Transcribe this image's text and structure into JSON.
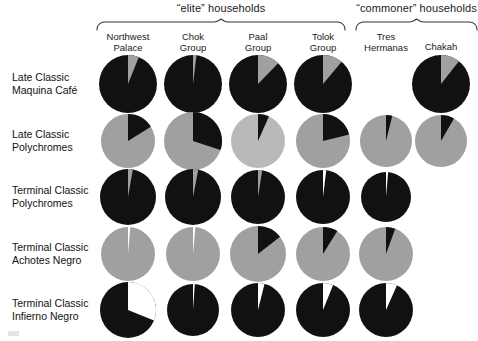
{
  "figure": {
    "colors": {
      "dark": "#111111",
      "light": "#a0a0a0",
      "white": "#ffffff",
      "brace": "#333333"
    },
    "group_braces": [
      {
        "label": "“elite” households",
        "x": 96,
        "y": 18,
        "width": 250,
        "label_y": 2
      },
      {
        "label": "“commoner” households",
        "x": 355,
        "y": 18,
        "width": 123,
        "label_y": 2
      }
    ],
    "columns": [
      {
        "id": "northwest-palace",
        "label_line1": "Northwest",
        "label_line2": "Palace",
        "cx": 128
      },
      {
        "id": "chok-group",
        "label_line1": "Chok",
        "label_line2": "Group",
        "cx": 193
      },
      {
        "id": "paal-group",
        "label_line1": "Paal",
        "label_line2": "Group",
        "cx": 258
      },
      {
        "id": "tolok-group",
        "label_line1": "Tolok",
        "label_line2": "Group",
        "cx": 323
      },
      {
        "id": "tres-hermanas",
        "label_line1": "Tres",
        "label_line2": "Hermanas",
        "cx": 386
      },
      {
        "id": "chakah",
        "label_line1": "Chakah",
        "label_line2": "",
        "cx": 441
      }
    ],
    "rows": [
      {
        "id": "late-classic-maquina-cafe",
        "label_line1": "Late Classic",
        "label_line2": "Maquina Café",
        "cy": 84
      },
      {
        "id": "late-classic-polychromes",
        "label_line1": "Late Classic",
        "label_line2": "Polychromes",
        "cy": 141
      },
      {
        "id": "terminal-classic-polychromes",
        "label_line1": "Terminal Classic",
        "label_line2": "Polychromes",
        "cy": 197
      },
      {
        "id": "terminal-classic-achotes-negro",
        "label_line1": "Terminal Classic",
        "label_line2": "Achotes Negro",
        "cy": 254
      },
      {
        "id": "terminal-classic-infierno-negro",
        "label_line1": "Terminal Classic",
        "label_line2": "Infierno Negro",
        "cy": 310
      }
    ]
  },
  "chart_data": {
    "type": "pie",
    "legend": [
      {
        "name": "present / dark fraction",
        "color": "#111111"
      },
      {
        "name": "remainder / light fraction",
        "color": "#a0a0a0"
      },
      {
        "name": "absent / white wedge",
        "color": "#ffffff"
      }
    ],
    "categories": [
      "Northwest Palace",
      "Chok Group",
      "Paal Group",
      "Tolok Group",
      "Tres Hermanas",
      "Chakah"
    ],
    "row_names": [
      "Late Classic Maquina Café",
      "Late Classic Polychromes",
      "Terminal Classic Polychromes",
      "Terminal Classic Achotes Negro",
      "Terminal Classic Infierno Negro"
    ],
    "pies": [
      {
        "row": "Late Classic Maquina Café",
        "cells": [
          {
            "column": "Northwest Palace",
            "present": true,
            "radius": 29,
            "base": "#111111",
            "wedges": [
              {
                "color": "#a0a0a0",
                "start": 0,
                "end": 22
              }
            ],
            "values": {
              "dark": 94,
              "light": 6
            }
          },
          {
            "column": "Chok Group",
            "present": true,
            "radius": 29,
            "base": "#111111",
            "wedges": [
              {
                "color": "#a0a0a0",
                "start": 0,
                "end": 7
              }
            ],
            "values": {
              "dark": 98,
              "light": 2
            }
          },
          {
            "column": "Paal Group",
            "present": true,
            "radius": 29,
            "base": "#111111",
            "wedges": [
              {
                "color": "#a0a0a0",
                "start": 0,
                "end": 44
              }
            ],
            "values": {
              "dark": 88,
              "light": 12
            }
          },
          {
            "column": "Tolok Group",
            "present": true,
            "radius": 29,
            "base": "#111111",
            "wedges": [
              {
                "color": "#a0a0a0",
                "start": 0,
                "end": 40
              }
            ],
            "values": {
              "dark": 89,
              "light": 11
            }
          },
          {
            "column": "Tres Hermanas",
            "present": false,
            "radius": 29,
            "base": "#111111",
            "wedges": [],
            "values": null
          },
          {
            "column": "Chakah",
            "present": true,
            "radius": 29,
            "base": "#111111",
            "wedges": [
              {
                "color": "#a0a0a0",
                "start": 0,
                "end": 38
              }
            ],
            "values": {
              "dark": 89,
              "light": 11
            }
          }
        ]
      },
      {
        "row": "Late Classic Polychromes",
        "cells": [
          {
            "column": "Northwest Palace",
            "present": true,
            "radius": 27,
            "base": "#a0a0a0",
            "wedges": [
              {
                "color": "#111111",
                "start": 0,
                "end": 58
              }
            ],
            "values": {
              "dark": 16,
              "light": 84
            }
          },
          {
            "column": "Chok Group",
            "present": true,
            "radius": 29,
            "base": "#a0a0a0",
            "wedges": [
              {
                "color": "#111111",
                "start": 0,
                "end": 108
              }
            ],
            "values": {
              "dark": 30,
              "light": 70
            }
          },
          {
            "column": "Paal Group",
            "present": true,
            "radius": 27,
            "base": "#b9b9b9",
            "wedges": [
              {
                "color": "#111111",
                "start": 0,
                "end": 24
              }
            ],
            "values": {
              "dark": 7,
              "light": 93
            }
          },
          {
            "column": "Tolok Group",
            "present": true,
            "radius": 27,
            "base": "#a0a0a0",
            "wedges": [
              {
                "color": "#111111",
                "start": 0,
                "end": 76
              }
            ],
            "values": {
              "dark": 21,
              "light": 79
            }
          },
          {
            "column": "Tres Hermanas",
            "present": true,
            "radius": 26,
            "base": "#a0a0a0",
            "wedges": [
              {
                "color": "#111111",
                "start": 0,
                "end": 14
              }
            ],
            "values": {
              "dark": 4,
              "light": 96
            }
          },
          {
            "column": "Chakah",
            "present": true,
            "radius": 26,
            "base": "#a0a0a0",
            "wedges": [
              {
                "color": "#111111",
                "start": 0,
                "end": 30
              }
            ],
            "values": {
              "dark": 8,
              "light": 92
            }
          }
        ]
      },
      {
        "row": "Terminal Classic Polychromes",
        "cells": [
          {
            "column": "Northwest Palace",
            "present": true,
            "radius": 28,
            "base": "#111111",
            "wedges": [
              {
                "color": "#a0a0a0",
                "start": 0,
                "end": 10
              }
            ],
            "values": {
              "dark": 97,
              "light": 3
            }
          },
          {
            "column": "Chok Group",
            "present": true,
            "radius": 28,
            "base": "#111111",
            "wedges": [
              {
                "color": "#a0a0a0",
                "start": 0,
                "end": 11
              }
            ],
            "values": {
              "dark": 97,
              "light": 3
            }
          },
          {
            "column": "Paal Group",
            "present": true,
            "radius": 27,
            "base": "#111111",
            "wedges": [
              {
                "color": "#a0a0a0",
                "start": 0,
                "end": 9
              }
            ],
            "values": {
              "dark": 98,
              "light": 2
            }
          },
          {
            "column": "Tolok Group",
            "present": true,
            "radius": 27,
            "base": "#111111",
            "wedges": [
              {
                "color": "#ffffff",
                "start": 0,
                "end": 7
              }
            ],
            "values": {
              "dark": 98,
              "light": 2
            }
          },
          {
            "column": "Tres Hermanas",
            "present": true,
            "radius": 25,
            "base": "#111111",
            "wedges": [
              {
                "color": "#ffffff",
                "start": 0,
                "end": 5
              }
            ],
            "values": {
              "dark": 99,
              "light": 1
            }
          },
          {
            "column": "Chakah",
            "present": false,
            "radius": 26,
            "base": "#111111",
            "wedges": [],
            "values": null
          }
        ]
      },
      {
        "row": "Terminal Classic Achotes Negro",
        "cells": [
          {
            "column": "Northwest Palace",
            "present": true,
            "radius": 27,
            "base": "#a0a0a0",
            "wedges": [
              {
                "color": "#ffffff",
                "start": 0,
                "end": 5
              }
            ],
            "values": {
              "dark": 1,
              "light": 99
            }
          },
          {
            "column": "Chok Group",
            "present": true,
            "radius": 27,
            "base": "#a0a0a0",
            "wedges": [
              {
                "color": "#ffffff",
                "start": 0,
                "end": 5
              }
            ],
            "values": {
              "dark": 1,
              "light": 99
            }
          },
          {
            "column": "Paal Group",
            "present": true,
            "radius": 28,
            "base": "#a0a0a0",
            "wedges": [
              {
                "color": "#111111",
                "start": 0,
                "end": 52
              }
            ],
            "values": {
              "dark": 14,
              "light": 86
            }
          },
          {
            "column": "Tolok Group",
            "present": true,
            "radius": 27,
            "base": "#a0a0a0",
            "wedges": [
              {
                "color": "#111111",
                "start": 0,
                "end": 32
              }
            ],
            "values": {
              "dark": 9,
              "light": 91
            }
          },
          {
            "column": "Tres Hermanas",
            "present": true,
            "radius": 27,
            "base": "#a0a0a0",
            "wedges": [
              {
                "color": "#111111",
                "start": 0,
                "end": 20
              }
            ],
            "values": {
              "dark": 6,
              "light": 94
            }
          },
          {
            "column": "Chakah",
            "present": false,
            "radius": 26,
            "base": "#a0a0a0",
            "wedges": [],
            "values": null
          }
        ]
      },
      {
        "row": "Terminal Classic Infierno Negro",
        "cells": [
          {
            "column": "Northwest Palace",
            "present": true,
            "radius": 28,
            "base": "#111111",
            "wedges": [
              {
                "color": "#ffffff",
                "start": 0,
                "end": 112
              }
            ],
            "values": {
              "dark": 69,
              "light": 31
            }
          },
          {
            "column": "Chok Group",
            "present": true,
            "radius": 26,
            "base": "#111111",
            "wedges": [
              {
                "color": "#ffffff",
                "start": 0,
                "end": 4
              }
            ],
            "values": {
              "dark": 99,
              "light": 1
            }
          },
          {
            "column": "Paal Group",
            "present": true,
            "radius": 27,
            "base": "#111111",
            "wedges": [
              {
                "color": "#ffffff",
                "start": 0,
                "end": 14
              }
            ],
            "values": {
              "dark": 96,
              "light": 4
            }
          },
          {
            "column": "Tolok Group",
            "present": true,
            "radius": 27,
            "base": "#111111",
            "wedges": [
              {
                "color": "#ffffff",
                "start": 0,
                "end": 22
              }
            ],
            "values": {
              "dark": 94,
              "light": 6
            }
          },
          {
            "column": "Tres Hermanas",
            "present": true,
            "radius": 27,
            "base": "#111111",
            "wedges": [
              {
                "color": "#ffffff",
                "start": 0,
                "end": 24
              }
            ],
            "values": {
              "dark": 93,
              "light": 7
            }
          },
          {
            "column": "Chakah",
            "present": false,
            "radius": 26,
            "base": "#111111",
            "wedges": [],
            "values": null
          }
        ]
      }
    ]
  }
}
